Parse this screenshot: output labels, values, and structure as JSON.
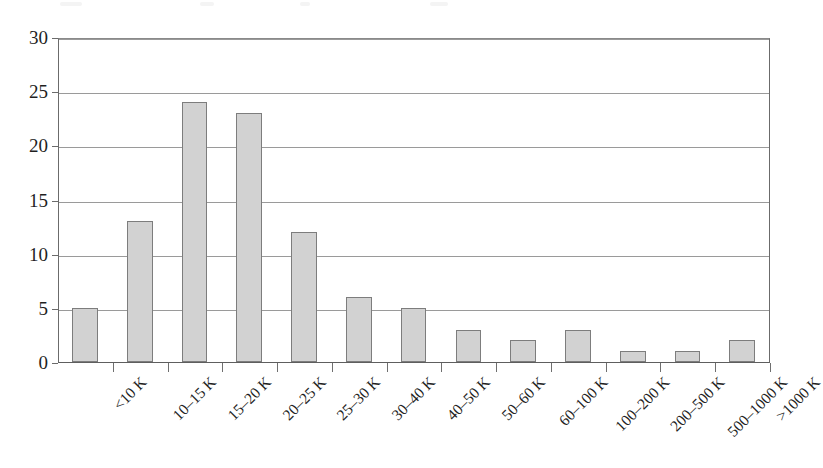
{
  "chart_data": {
    "type": "bar",
    "title": "",
    "subtitle": "",
    "xlabel": "",
    "ylabel": "",
    "categories": [
      "<10 K",
      "10–15 K",
      "15–20 K",
      "20–25 K",
      "25–30 K",
      "30–40 K",
      "40–50 K",
      "50–60 K",
      "60–100 K",
      "100–200 K",
      "200–500 K",
      "500–1000 K",
      ">1000 K"
    ],
    "values": [
      5,
      13,
      24,
      23,
      12,
      6,
      5,
      3,
      2,
      3,
      1,
      1,
      2
    ],
    "ylim": [
      0,
      30
    ],
    "yticks": [
      0,
      5,
      10,
      15,
      20,
      25,
      30
    ],
    "ytick_labels": [
      "0",
      "5",
      "10",
      "15",
      "20",
      "25",
      "30"
    ],
    "grid": true,
    "grid_axis": "y",
    "legend": false,
    "legend_position": "none",
    "bar_fill_color": "#d2d2d2",
    "bar_edge_color": "#7d7d7d",
    "gridline_color": "#9a9a9a",
    "axis_color": "#6b6b6b",
    "text_color": "#1f1f1f",
    "background_color": "#ffffff",
    "xtick_label_rotation": -45,
    "bars": [
      {
        "category": "<10 K",
        "value": 5
      },
      {
        "category": "10–15 K",
        "value": 13
      },
      {
        "category": "15–20 K",
        "value": 24
      },
      {
        "category": "20–25 K",
        "value": 23
      },
      {
        "category": "25–30 K",
        "value": 12
      },
      {
        "category": "30–40 K",
        "value": 6
      },
      {
        "category": "40–50 K",
        "value": 5
      },
      {
        "category": "50–60 K",
        "value": 3
      },
      {
        "category": "60–100 K",
        "value": 2
      },
      {
        "category": "100–200 K",
        "value": 3
      },
      {
        "category": "200–500 K",
        "value": 1
      },
      {
        "category": "500–1000 K",
        "value": 1
      },
      {
        "category": ">1000 K",
        "value": 2
      }
    ]
  }
}
